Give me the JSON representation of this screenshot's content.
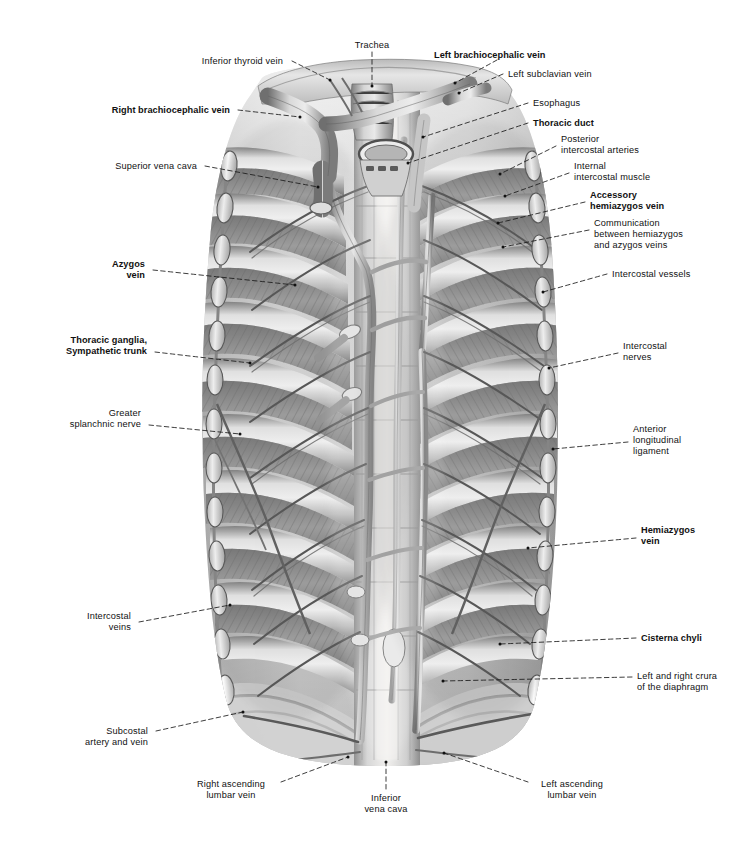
{
  "figure": {
    "style": "grayscale airbrush / pencil anatomical plate",
    "background_color": "#ffffff",
    "ink_color": "#111111",
    "leader_line_style": "dashed",
    "canvas": {
      "width": 736,
      "height": 845
    }
  },
  "labels": [
    {
      "id": "inferior-thyroid-vein",
      "text": "Inferior thyroid vein",
      "bold": false,
      "align": "right",
      "x": 283,
      "y": 56,
      "anchor_x": 292,
      "anchor_y": 61,
      "target_x": 330,
      "target_y": 80
    },
    {
      "id": "trachea",
      "text": "Trachea",
      "bold": false,
      "align": "center",
      "x": 372,
      "y": 40,
      "anchor_x": 372,
      "anchor_y": 52,
      "target_x": 372,
      "target_y": 86
    },
    {
      "id": "left-brachiocephalic-vein",
      "text": "Left brachiocephalic vein",
      "bold": true,
      "align": "left",
      "x": 434,
      "y": 50,
      "anchor_x": 497,
      "anchor_y": 60,
      "target_x": 455,
      "target_y": 83
    },
    {
      "id": "left-subclavian-vein",
      "text": "Left subclavian vein",
      "bold": false,
      "align": "left",
      "x": 508,
      "y": 69,
      "anchor_x": 503,
      "anchor_y": 74,
      "target_x": 459,
      "target_y": 93
    },
    {
      "id": "right-brachiocephalic-vein",
      "text": "Right brachiocephalic vein",
      "bold": true,
      "align": "right",
      "x": 230,
      "y": 105,
      "anchor_x": 238,
      "anchor_y": 110,
      "target_x": 300,
      "target_y": 117
    },
    {
      "id": "esophagus",
      "text": "Esophagus",
      "bold": false,
      "align": "left",
      "x": 533,
      "y": 98,
      "anchor_x": 528,
      "anchor_y": 103,
      "target_x": 423,
      "target_y": 137
    },
    {
      "id": "thoracic-duct",
      "text": "Thoracic duct",
      "bold": true,
      "align": "left",
      "x": 533,
      "y": 118,
      "anchor_x": 528,
      "anchor_y": 123,
      "target_x": 408,
      "target_y": 163
    },
    {
      "id": "posterior-intercostal-arteries",
      "text": "Posterior\nintercostal arteries",
      "bold": false,
      "align": "left",
      "x": 561,
      "y": 134,
      "anchor_x": 556,
      "anchor_y": 146,
      "target_x": 500,
      "target_y": 174
    },
    {
      "id": "internal-intercostal-muscle",
      "text": "Internal\nintercostal muscle",
      "bold": false,
      "align": "left",
      "x": 574,
      "y": 161,
      "anchor_x": 569,
      "anchor_y": 173,
      "target_x": 505,
      "target_y": 196
    },
    {
      "id": "superior-vena-cava",
      "text": "Superior vena cava",
      "bold": false,
      "align": "right",
      "x": 197,
      "y": 161,
      "anchor_x": 205,
      "anchor_y": 166,
      "target_x": 318,
      "target_y": 187
    },
    {
      "id": "accessory-hemiazygos-vein",
      "text": "Accessory\nhemiazygos vein",
      "bold": true,
      "align": "left",
      "x": 590,
      "y": 190,
      "anchor_x": 585,
      "anchor_y": 202,
      "target_x": 498,
      "target_y": 223
    },
    {
      "id": "communication-hemiazygos-azygos",
      "text": "Communication\nbetween hemiazygos\nand azygos veins",
      "bold": false,
      "align": "left",
      "x": 594,
      "y": 218,
      "anchor_x": 589,
      "anchor_y": 230,
      "target_x": 503,
      "target_y": 247
    },
    {
      "id": "azygos-vein",
      "text": "Azygos\nvein",
      "bold": true,
      "align": "right",
      "x": 145,
      "y": 259,
      "anchor_x": 153,
      "anchor_y": 270,
      "target_x": 295,
      "target_y": 285
    },
    {
      "id": "intercostal-vessels",
      "text": "Intercostal vessels",
      "bold": false,
      "align": "left",
      "x": 612,
      "y": 269,
      "anchor_x": 607,
      "anchor_y": 274,
      "target_x": 543,
      "target_y": 292
    },
    {
      "id": "thoracic-ganglia-sympathetic-trunk",
      "text": "Thoracic ganglia,\nSympathetic trunk",
      "bold": true,
      "align": "right",
      "x": 147,
      "y": 335,
      "anchor_x": 155,
      "anchor_y": 352,
      "target_x": 250,
      "target_y": 363
    },
    {
      "id": "intercostal-nerves",
      "text": "Intercostal\nnerves",
      "bold": false,
      "align": "left",
      "x": 623,
      "y": 341,
      "anchor_x": 618,
      "anchor_y": 353,
      "target_x": 549,
      "target_y": 368
    },
    {
      "id": "greater-splanchnic-nerve",
      "text": "Greater\nsplanchnic nerve",
      "bold": false,
      "align": "right",
      "x": 141,
      "y": 408,
      "anchor_x": 149,
      "anchor_y": 425,
      "target_x": 240,
      "target_y": 434
    },
    {
      "id": "anterior-longitudinal-ligament",
      "text": "Anterior\nlongitudinal\nligament",
      "bold": false,
      "align": "left",
      "x": 633,
      "y": 424,
      "anchor_x": 628,
      "anchor_y": 442,
      "target_x": 553,
      "target_y": 449
    },
    {
      "id": "hemiazygos-vein",
      "text": "Hemiazygos\nvein",
      "bold": true,
      "align": "left",
      "x": 641,
      "y": 525,
      "anchor_x": 636,
      "anchor_y": 538,
      "target_x": 528,
      "target_y": 548
    },
    {
      "id": "intercostal-veins",
      "text": "Intercostal\nveins",
      "bold": false,
      "align": "right",
      "x": 131,
      "y": 611,
      "anchor_x": 139,
      "anchor_y": 622,
      "target_x": 230,
      "target_y": 605
    },
    {
      "id": "cisterna-chyli",
      "text": "Cisterna chyli",
      "bold": true,
      "align": "left",
      "x": 641,
      "y": 633,
      "anchor_x": 636,
      "anchor_y": 638,
      "target_x": 500,
      "target_y": 644
    },
    {
      "id": "left-and-right-crura",
      "text": "Left and right crura\nof the diaphragm",
      "bold": false,
      "align": "left",
      "x": 637,
      "y": 671,
      "anchor_x": 632,
      "anchor_y": 677,
      "target_x": 443,
      "target_y": 681
    },
    {
      "id": "subcostal-artery-and-vein",
      "text": "Subcostal\nartery and vein",
      "bold": false,
      "align": "right",
      "x": 148,
      "y": 726,
      "anchor_x": 156,
      "anchor_y": 731,
      "target_x": 243,
      "target_y": 712
    },
    {
      "id": "right-ascending-lumbar-vein",
      "text": "Right ascending\nlumbar vein",
      "bold": false,
      "align": "center",
      "x": 231,
      "y": 779,
      "anchor_x": 281,
      "anchor_y": 782,
      "target_x": 348,
      "target_y": 757
    },
    {
      "id": "inferior-vena-cava",
      "text": "Inferior\nvena cava",
      "bold": false,
      "align": "center",
      "x": 386,
      "y": 793,
      "anchor_x": 386,
      "anchor_y": 789,
      "target_x": 386,
      "target_y": 762
    },
    {
      "id": "left-ascending-lumbar-vein",
      "text": "Left ascending\nlumbar vein",
      "bold": false,
      "align": "center",
      "x": 572,
      "y": 779,
      "anchor_x": 528,
      "anchor_y": 782,
      "target_x": 444,
      "target_y": 753
    }
  ],
  "anatomy": {
    "regions": [
      {
        "id": "thoracic-cage",
        "name": "Posterior thoracic wall, opened anteriorly"
      },
      {
        "id": "rib-bands",
        "name": "Ribs with internal intercostal muscle hatching",
        "count": 11
      },
      {
        "id": "vertebral-column",
        "name": "Vertebral bodies and anterior longitudinal ligament"
      },
      {
        "id": "azygos-system",
        "name": "Azygos, hemiazygos and accessory hemiazygos veins"
      },
      {
        "id": "thoracic-duct-vessel",
        "name": "Thoracic duct ascending to left of aorta"
      },
      {
        "id": "sympathetic-chain-left",
        "name": "Sympathetic trunk with thoracic ganglia (viewer left)"
      },
      {
        "id": "sympathetic-chain-right",
        "name": "Sympathetic trunk with thoracic ganglia (viewer right)"
      },
      {
        "id": "diaphragm",
        "name": "Diaphragmatic crura at inferior border"
      },
      {
        "id": "great-vessels",
        "name": "Brachiocephalic veins, superior vena cava, trachea, esophagus"
      }
    ]
  }
}
